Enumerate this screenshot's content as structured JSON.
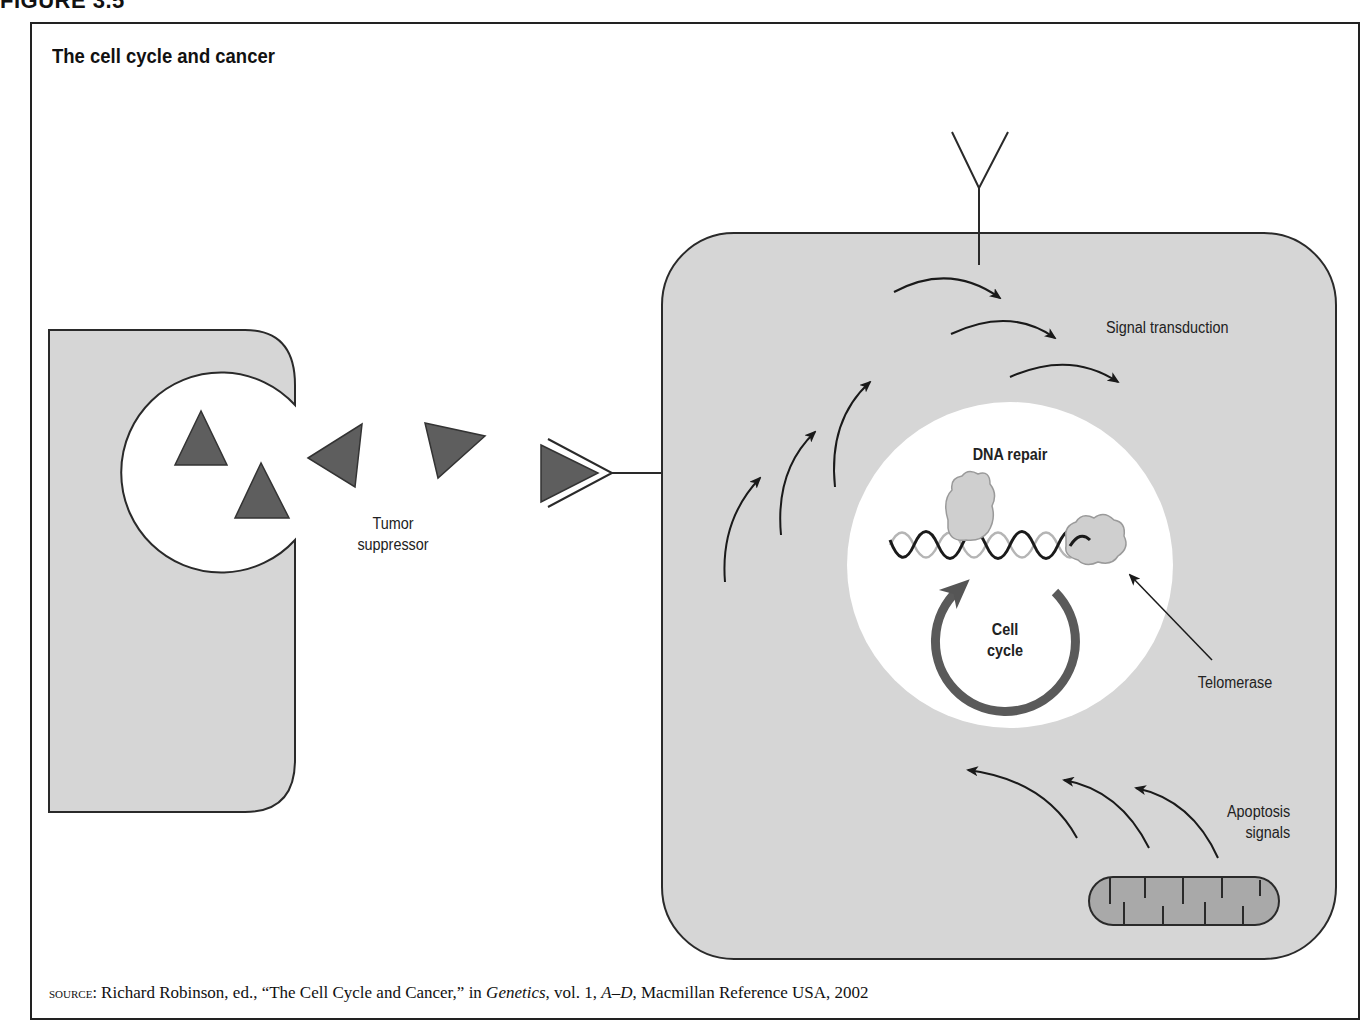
{
  "figure": {
    "label": "FIGURE 3.5",
    "title": "The cell cycle and cancer"
  },
  "labels": {
    "tumor_suppressor": "Tumor suppressor",
    "signal_transduction": "Signal transduction",
    "dna_repair": "DNA repair",
    "cell_cycle_line1": "Cell",
    "cell_cycle_line2": "cycle",
    "telomerase": "Telomerase",
    "apoptosis_line1": "Apoptosis",
    "apoptosis_line2": "signals"
  },
  "source": {
    "prefix": "source:",
    "text1": " Richard Robinson, ed., “The Cell Cycle and Cancer,” in ",
    "book": "Genetics",
    "text2": ", vol. 1, ",
    "volume_range": "A–D",
    "text3": ", Macmillan Reference USA, 2002"
  },
  "colors": {
    "cell_fill": "#d6d6d6",
    "triangle_fill": "#5e5e5e",
    "nucleus_fill": "#ffffff",
    "mitochondrion_fill": "#a9a9a9",
    "outline": "#2a2a2a"
  }
}
